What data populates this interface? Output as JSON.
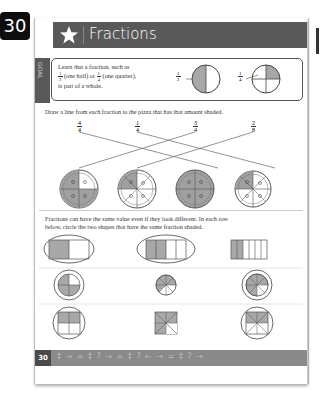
{
  "page_number": "30",
  "header": {
    "title": "Fractions",
    "icon": "star-icon"
  },
  "goal": {
    "tab_label": "GOAL",
    "text_line1": "Learn that a fraction, such as",
    "frac_half": {
      "num": "1",
      "den": "2"
    },
    "text_half": "(one half) or",
    "frac_quarter": {
      "num": "1",
      "den": "4"
    },
    "text_quarter": "(one quarter),",
    "text_line3": "is part of a whole.",
    "example_half": {
      "num": "1",
      "den": "2"
    },
    "example_quarter": {
      "num": "1",
      "den": "4"
    }
  },
  "section1": {
    "instruction": "Draw a line from each fraction to the pizza that has that amount shaded.",
    "fractions": [
      {
        "num": "4",
        "den": "4"
      },
      {
        "num": "1",
        "den": "4"
      },
      {
        "num": "3",
        "den": "4"
      },
      {
        "num": "2",
        "den": "8"
      }
    ],
    "pizzas": [
      "3/4 shaded",
      "1/4 shaded",
      "4/4 shaded",
      "2/8 shaded"
    ]
  },
  "section2": {
    "instruction_line1": "Fractions can have the same value even if they look different. In each row",
    "instruction_line2": "below, circle the two shapes that have the same fraction shaded.",
    "rows": [
      [
        "1/2 rectangle (circled)",
        "2/4 rectangle (circled)",
        "2/6 rectangle"
      ],
      [
        "3/4 circle (circled)",
        "5/8 circle",
        "6/8 circle (circled)"
      ],
      [
        "2/4 square (circled)",
        "5/8 square",
        "4/8 square (circled)"
      ]
    ]
  },
  "footer": {
    "page_number": "30",
    "decoration": "‡ → = ‡ ? → = ‡ ? ← → = ‡ ? →"
  }
}
